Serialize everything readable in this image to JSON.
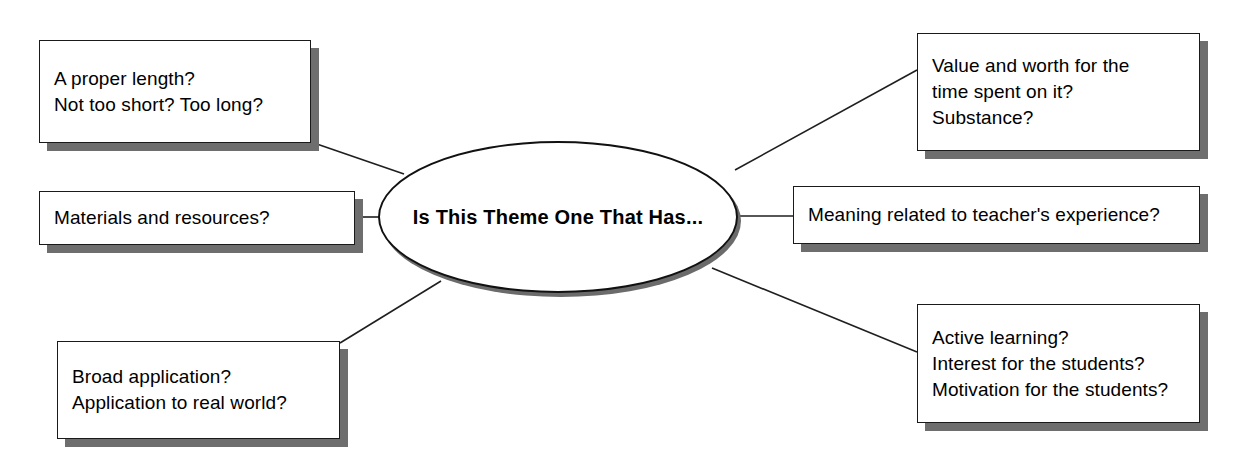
{
  "diagram": {
    "title": "Is This Theme One That Has...",
    "center": {
      "label": "Is This Theme One That Has...",
      "shape": "ellipse"
    },
    "nodes": [
      {
        "id": "length",
        "name": "proper-length",
        "text": "A proper length?\nNot too short? Too long?",
        "side": "left",
        "position": "top"
      },
      {
        "id": "materials",
        "name": "materials-resources",
        "text": "Materials and resources?",
        "side": "left",
        "position": "middle"
      },
      {
        "id": "broad",
        "name": "broad-application",
        "text": "Broad application?\nApplication to real world?",
        "side": "left",
        "position": "bottom"
      },
      {
        "id": "value",
        "name": "value-and-worth",
        "text": "Value and worth for the\ntime spent on it?\nSubstance?",
        "side": "right",
        "position": "top"
      },
      {
        "id": "meaning",
        "name": "meaning-teacher-experience",
        "text": "Meaning related to teacher's experience?",
        "side": "right",
        "position": "middle"
      },
      {
        "id": "active",
        "name": "active-learning",
        "text": "Active learning?\nInterest for the students?\nMotivation for the students?",
        "side": "right",
        "position": "bottom"
      }
    ],
    "connectors": [
      {
        "from": "length",
        "to": "center",
        "path": "M 311 142 L 404 174"
      },
      {
        "from": "materials",
        "to": "center",
        "path": "M 355 217 L 380 217"
      },
      {
        "from": "broad",
        "to": "center",
        "path": "M 340 343 L 441 281"
      },
      {
        "from": "center",
        "to": "value",
        "path": "M 735 170 L 917 70"
      },
      {
        "from": "center",
        "to": "meaning",
        "path": "M 736 216 L 793 216"
      },
      {
        "from": "center",
        "to": "active",
        "path": "M 712 268 L 917 352"
      }
    ],
    "colors": {
      "ink": "#000000",
      "line": "#1f1f1f",
      "shadow": "#6e6e6e",
      "background": "#ffffff"
    }
  }
}
